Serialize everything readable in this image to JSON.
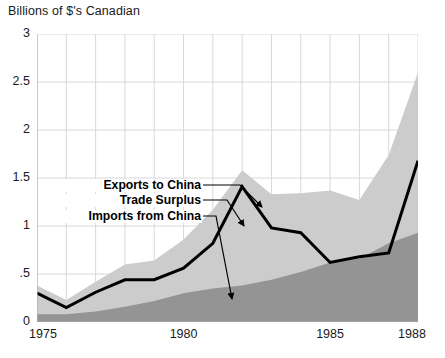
{
  "chart_data": {
    "type": "area",
    "title": "",
    "ylabel": "Billions of $'s Canadian",
    "xlabel": "",
    "axis_title": "Billions of $'s Canadian",
    "x": [
      1975,
      1976,
      1977,
      1978,
      1979,
      1980,
      1981,
      1982,
      1983,
      1984,
      1985,
      1986,
      1987,
      1988
    ],
    "xlim": [
      1975,
      1988
    ],
    "ylim": [
      0,
      3
    ],
    "yticks": [
      0,
      0.5,
      1,
      1.5,
      2,
      2.5,
      3
    ],
    "ytick_labels": [
      "0",
      ".5",
      "1",
      "1.5",
      "2",
      "2.5",
      "3"
    ],
    "xticks": [
      1975,
      1980,
      1985,
      1988
    ],
    "xtick_labels": [
      "1975",
      "1980",
      "1985",
      "1988"
    ],
    "grid": true,
    "legend": "inline-annotations",
    "series": [
      {
        "name": "Exports to China",
        "kind": "area",
        "color": "#cccccc",
        "values": [
          0.38,
          0.23,
          0.42,
          0.6,
          0.64,
          0.86,
          1.17,
          1.58,
          1.33,
          1.34,
          1.37,
          1.27,
          1.74,
          2.6
        ]
      },
      {
        "name": "Imports from China",
        "kind": "area",
        "color": "#949494",
        "values": [
          0.08,
          0.08,
          0.11,
          0.16,
          0.22,
          0.3,
          0.35,
          0.38,
          0.44,
          0.52,
          0.62,
          0.66,
          0.82,
          0.93
        ]
      },
      {
        "name": "Trade Surplus",
        "kind": "line",
        "color": "#000000",
        "values": [
          0.3,
          0.15,
          0.31,
          0.44,
          0.44,
          0.56,
          0.82,
          1.41,
          0.98,
          0.93,
          0.62,
          0.68,
          0.72,
          1.68
        ]
      }
    ],
    "annotations": [
      {
        "text": "Exports to China",
        "points_to": "exports-area"
      },
      {
        "text": "Trade Surplus",
        "points_to": "trade-surplus-line"
      },
      {
        "text": "Imports from China",
        "points_to": "imports-area"
      }
    ]
  }
}
